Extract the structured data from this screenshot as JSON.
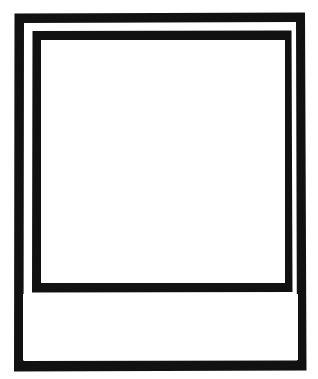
{
  "figure": {
    "kind": "polaroid-frame-outline",
    "title": "",
    "caption_text": "",
    "photo_area_text": "",
    "background_color": "#ffffff",
    "ink_color": "#111111",
    "stroke_style": "hand-drawn-solid"
  },
  "geometry": {
    "canvas": {
      "width": 318,
      "height": 379
    },
    "outer_frame": {
      "label": "outer-border",
      "x": 13,
      "y": 12,
      "width": 294,
      "height": 360,
      "stroke_width": 10
    },
    "inner_frame": {
      "label": "photo-border",
      "x": 31,
      "y": 30,
      "width": 262,
      "height": 263,
      "stroke_width": 10
    },
    "photo_window": {
      "label": "photo-area",
      "x": 41,
      "y": 40,
      "width": 244,
      "height": 243
    },
    "caption_strip": {
      "label": "caption-area",
      "x": 23,
      "y": 294,
      "width": 275,
      "height": 66
    }
  },
  "shapes": {
    "outer_frame_path": "M14.5,13.5 L305.0,12.5 L306.5,370.5 L14.0,371.5 Z",
    "outer_frame_inner_path": "M24.0,23.0 L296.0,22.0 L297.0,360.5 L23.5,361.0 Z",
    "inner_frame_path": "M32.5,31.0 L291.5,30.5 L292.5,292.0 L32.0,292.5 Z",
    "inner_frame_inner_path": "M42.0,40.5 L284.0,40.0 L284.5,282.5 L41.5,283.0 Z"
  }
}
